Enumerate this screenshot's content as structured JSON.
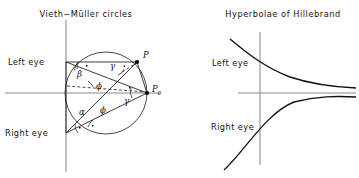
{
  "figure": {
    "width": 359,
    "height": 178,
    "background": "#ffffff",
    "ink_color": "#111111",
    "axis_color": "#8a8a8a"
  },
  "left_panel": {
    "title": "Vieth−Müller circles",
    "labels": {
      "left_eye": "Left eye",
      "right_eye": "Right eye",
      "point_p": "P",
      "point_p0": "P",
      "point_p0_sub": "0"
    },
    "angles": [
      {
        "name": "beta",
        "symbol": "β",
        "x": 77,
        "y": 77
      },
      {
        "name": "gamma-upper",
        "symbol": "γ",
        "x": 110,
        "y": 69
      },
      {
        "name": "gamma-lower",
        "symbol": "γ",
        "x": 124,
        "y": 104
      },
      {
        "name": "phi-upper",
        "symbol": "ϕ",
        "x": 96,
        "y": 89
      },
      {
        "name": "phi-lower",
        "symbol": "ϕ",
        "x": 100,
        "y": 113
      },
      {
        "name": "alpha",
        "symbol": "α",
        "x": 79,
        "y": 115
      }
    ],
    "geometry": {
      "circle_center_x": 106,
      "circle_center_y": 93,
      "circle_radius": 41,
      "left_eye_x": 66,
      "left_eye_y": 62,
      "right_eye_x": 66,
      "right_eye_y": 133,
      "p_x": 137,
      "p_y": 62,
      "p0_x": 147,
      "p0_y": 93,
      "vertical_axis_x": 66,
      "vertical_axis_top": 20,
      "vertical_axis_bottom": 172,
      "horizontal_axis_y": 93,
      "horizontal_axis_left": 5,
      "horizontal_axis_right": 160
    }
  },
  "right_panel": {
    "title": "Hyperbolae of Hillebrand",
    "labels": {
      "left_eye": "Left eye",
      "right_eye": "Right eye"
    },
    "geometry": {
      "vertical_axis_x": 260,
      "vertical_axis_top": 32,
      "vertical_axis_bottom": 165,
      "horizontal_axis_y": 93,
      "horizontal_axis_left": 238,
      "horizontal_axis_right": 356
    }
  }
}
